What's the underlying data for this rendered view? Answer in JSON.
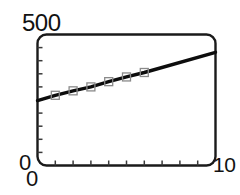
{
  "chart_data": {
    "type": "line",
    "title": "",
    "subtitle": "",
    "xlabel": "",
    "ylabel": "",
    "xlim": [
      0,
      10
    ],
    "ylim": [
      0,
      500
    ],
    "grid": false,
    "legend": null,
    "x_tick_labels": [
      "0",
      "10"
    ],
    "y_tick_labels": [
      "0",
      "500"
    ],
    "x_minor_tick_count": 9,
    "y_minor_tick_count": 9,
    "frame": "rounded-box",
    "series": [
      {
        "name": "trend-line",
        "marker": "open-square",
        "line_color": "#0d0d0d",
        "marker_color": "#8a8a8a",
        "x": [
          0.0,
          1.0,
          2.0,
          3.0,
          4.0,
          5.0,
          6.0,
          10.0
        ],
        "y": [
          248,
          268,
          285,
          300,
          320,
          338,
          355,
          432
        ],
        "marker_x": [
          1.0,
          2.0,
          3.0,
          4.0,
          5.0,
          6.0
        ],
        "marker_y": [
          268,
          285,
          300,
          320,
          338,
          355
        ]
      }
    ]
  },
  "axes": {
    "y_max_label": "500",
    "y_min_label": "0",
    "x_min_label": "0",
    "x_max_label": "10"
  },
  "colors": {
    "frame": "#1a1a1a",
    "line": "#0d0d0d",
    "marker_stroke": "#8a8a8a",
    "tick": "#3a3a3a",
    "text": "#121212",
    "background": "#ffffff"
  }
}
